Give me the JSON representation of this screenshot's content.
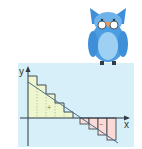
{
  "diagram": {
    "title": "",
    "axis_labels": {
      "x": "x",
      "y": "y"
    },
    "region_signs": {
      "positive": "+",
      "negative": "−"
    },
    "colors": {
      "panel_background": "#d6eff8",
      "positive_fill": "#eef6cf",
      "negative_fill": "#fbd9d6",
      "step_outline": "#2f3b45",
      "axis": "#2f3b45",
      "line": "#4a6e8a",
      "owl_body": "#4d9de3",
      "owl_belly": "#9ed0f3",
      "owl_beak": "#e79a59"
    }
  },
  "mascot": {
    "name": "owl",
    "accessory": "glasses"
  }
}
